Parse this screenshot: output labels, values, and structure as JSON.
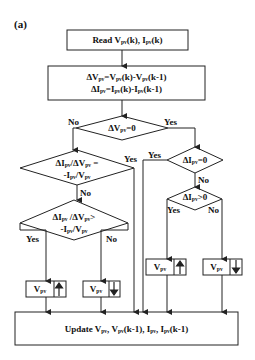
{
  "figure": {
    "label": "(a)"
  },
  "nodes": {
    "read": {
      "prefix": "Read V",
      "sub1": "pv",
      "mid": "(k), I",
      "sub2": "pv",
      "suffix": "(k)"
    },
    "delta": {
      "line1": {
        "a": "ΔV",
        "as": "pv",
        "b": "=V",
        "bs": "pv",
        "c": "(k)-V",
        "cs": "pv",
        "d": "(k-1)"
      },
      "line2": {
        "a": "ΔI",
        "as": "pv",
        "b": "=I",
        "bs": "pv",
        "c": "(k)-I",
        "cs": "pv",
        "d": "(k-1)"
      }
    },
    "d_dv_zero": {
      "a": "ΔV",
      "as": "pv",
      "b": "=0"
    },
    "d_incond_eq": {
      "line1": {
        "a": "ΔI",
        "as": "pv",
        "b": "/ΔV",
        "bs": "pv",
        "c": " ="
      },
      "line2": {
        "a": "-I",
        "as": "pv",
        "b": "/V",
        "bs": "pv"
      }
    },
    "d_incond_gt": {
      "line1": {
        "a": "ΔI",
        "as": "pv",
        "b": " /ΔV",
        "bs": "pv",
        "c": ">"
      },
      "line2": {
        "a": "-I",
        "as": "pv",
        "b": "/V",
        "bs": "pv"
      }
    },
    "d_di_zero": {
      "a": "ΔI",
      "as": "pv",
      "b": "=0"
    },
    "d_di_pos": {
      "a": "ΔI",
      "as": "pv",
      "b": ">0"
    },
    "v_inc_left": {
      "a": "V",
      "as": "pv",
      "arrow": "up"
    },
    "v_dec_left": {
      "a": "V",
      "as": "pv",
      "arrow": "down"
    },
    "v_inc_right": {
      "a": "V",
      "as": "pv",
      "arrow": "up"
    },
    "v_dec_right": {
      "a": "V",
      "as": "pv",
      "arrow": "down"
    },
    "update": {
      "a": "Update V",
      "as": "pv",
      "b": ", V",
      "bs": "pv",
      "c": "(k-1), I",
      "cs": "pv",
      "d": ", I",
      "ds": "pv",
      "e": "(k-1)"
    }
  },
  "edge_labels": {
    "dv_zero_no": "No",
    "dv_zero_yes": "Yes",
    "eq_yes": "Yes",
    "eq_no": "No",
    "gt_yes": "Yes",
    "gt_no": "No",
    "di_zero_yes": "Yes",
    "di_zero_no": "No",
    "di_pos_yes": "Yes",
    "di_pos_no": "No"
  },
  "colors": {
    "stroke": "#222222",
    "text": "#111111",
    "background": "#ffffff"
  }
}
